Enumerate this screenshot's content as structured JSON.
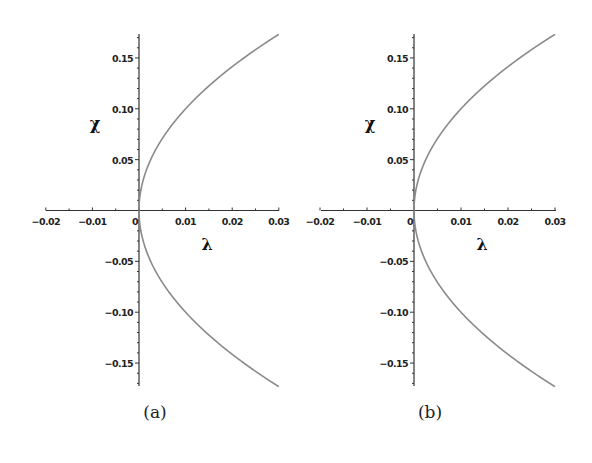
{
  "chart_data": [
    {
      "type": "line",
      "caption": "(a)",
      "xlabel": "λ",
      "ylabel": "χ",
      "xlim": [
        -0.02,
        0.03
      ],
      "ylim": [
        -0.175,
        0.175
      ],
      "x_ticks": [
        "-0.02",
        "-0.01",
        "0",
        "0.01",
        "0.02",
        "0.03"
      ],
      "y_ticks": [
        "0.15",
        "0.10",
        "0.05",
        "-0.05",
        "-0.10",
        "-0.15"
      ],
      "grid": false,
      "series": [
        {
          "name": "upper branch (χ = +√λ)",
          "x": [
            0,
            0.0005,
            0.001,
            0.0025,
            0.005,
            0.01,
            0.015,
            0.02,
            0.025,
            0.03
          ],
          "y": [
            0,
            0.022,
            0.032,
            0.05,
            0.071,
            0.1,
            0.122,
            0.141,
            0.158,
            0.173
          ]
        },
        {
          "name": "lower branch (χ = -√λ)",
          "x": [
            0,
            0.0005,
            0.001,
            0.0025,
            0.005,
            0.01,
            0.015,
            0.02,
            0.025,
            0.03
          ],
          "y": [
            0,
            -0.022,
            -0.032,
            -0.05,
            -0.071,
            -0.1,
            -0.122,
            -0.141,
            -0.158,
            -0.173
          ]
        }
      ],
      "line_color": "#8a8a8a",
      "axis_color": "#333333"
    },
    {
      "type": "line",
      "caption": "(b)",
      "xlabel": "λ",
      "ylabel": "χ",
      "xlim": [
        -0.02,
        0.03
      ],
      "ylim": [
        -0.175,
        0.175
      ],
      "x_ticks": [
        "-0.02",
        "-0.01",
        "0",
        "0.01",
        "0.02",
        "0.03"
      ],
      "y_ticks": [
        "0.15",
        "0.10",
        "0.05",
        "-0.05",
        "-0.10",
        "-0.15"
      ],
      "grid": false,
      "series": [
        {
          "name": "upper branch (χ = +√λ)",
          "x": [
            0,
            0.0005,
            0.001,
            0.0025,
            0.005,
            0.01,
            0.015,
            0.02,
            0.025,
            0.03
          ],
          "y": [
            0,
            0.022,
            0.032,
            0.05,
            0.071,
            0.1,
            0.122,
            0.141,
            0.158,
            0.173
          ]
        },
        {
          "name": "lower branch (χ = -√λ)",
          "x": [
            0,
            0.0005,
            0.001,
            0.0025,
            0.005,
            0.01,
            0.015,
            0.02,
            0.025,
            0.03
          ],
          "y": [
            0,
            -0.022,
            -0.032,
            -0.05,
            -0.071,
            -0.1,
            -0.122,
            -0.141,
            -0.158,
            -0.173
          ]
        }
      ],
      "line_color": "#8a8a8a",
      "axis_color": "#333333"
    }
  ],
  "panels": [
    {
      "caption": "(a)",
      "xlabel": "λ",
      "ylabel": "χ",
      "x_ticks": [
        "−0.02",
        "−0.01",
        "0",
        "0.01",
        "0.02",
        "0.03"
      ],
      "y_ticks_pos": [
        "0.15",
        "0.10",
        "0.05"
      ],
      "y_ticks_neg": [
        "−0.05",
        "−0.10",
        "−0.15"
      ]
    },
    {
      "caption": "(b)",
      "xlabel": "λ",
      "ylabel": "χ",
      "x_ticks": [
        "−0.02",
        "−0.01",
        "0",
        "0.01",
        "0.02",
        "0.03"
      ],
      "y_ticks_pos": [
        "0.15",
        "0.10",
        "0.05"
      ],
      "y_ticks_neg": [
        "−0.05",
        "−0.10",
        "−0.15"
      ]
    }
  ]
}
